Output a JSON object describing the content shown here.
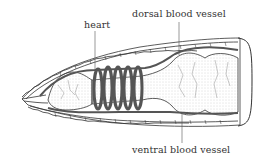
{
  "figure": {
    "labels": {
      "heart": "heart",
      "dorsal": "dorsal blood vessel",
      "ventral": "ventral blood vessel"
    },
    "colors": {
      "line": "#333333",
      "vessel": "#555555",
      "fill": "#ffffff",
      "stipple": "#bbbbbb"
    },
    "heart_count": 5
  }
}
